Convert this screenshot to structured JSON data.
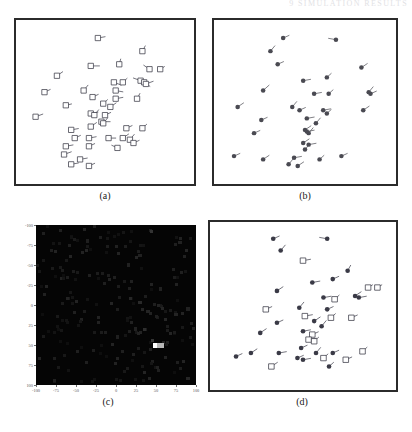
{
  "figure": {
    "running_head": "9 SIMULATION RESULTS",
    "panels": [
      {
        "id": "a",
        "caption": "(a)",
        "type": "scatter-vectors",
        "marker": "open-square-with-tail"
      },
      {
        "id": "b",
        "caption": "(b)",
        "type": "scatter-vectors",
        "marker": "filled-dot-with-tail"
      },
      {
        "id": "c",
        "caption": "(c)",
        "type": "heatmap",
        "marker": "intensity-grid"
      },
      {
        "id": "d",
        "caption": "(d)",
        "type": "scatter-vectors",
        "marker": "mixed-square-and-dot"
      }
    ]
  },
  "chart_data": [
    {
      "type": "scatter",
      "panel": "a",
      "title": "(a)",
      "xlabel": "",
      "ylabel": "",
      "xlim": [
        0,
        100
      ],
      "ylim": [
        0,
        100
      ],
      "grid": false,
      "legend": "none",
      "marker_style": "open square with short vector tail",
      "color": "#3a3a46",
      "points": [
        {
          "x": 46,
          "y": 89,
          "dx": 5,
          "dy": 1
        },
        {
          "x": 71,
          "y": 81,
          "dx": 2,
          "dy": 4
        },
        {
          "x": 42,
          "y": 72,
          "dx": 6,
          "dy": 0
        },
        {
          "x": 58,
          "y": 73,
          "dx": 1,
          "dy": 4
        },
        {
          "x": 75,
          "y": 70,
          "dx": -4,
          "dy": 3
        },
        {
          "x": 81,
          "y": 70,
          "dx": 3,
          "dy": 2
        },
        {
          "x": 23,
          "y": 66,
          "dx": 4,
          "dy": 3
        },
        {
          "x": 55,
          "y": 62,
          "dx": 5,
          "dy": -2
        },
        {
          "x": 60,
          "y": 62,
          "dx": 3,
          "dy": 3
        },
        {
          "x": 70,
          "y": 63,
          "dx": -5,
          "dy": 2
        },
        {
          "x": 72,
          "y": 62,
          "dx": 4,
          "dy": -3
        },
        {
          "x": 73,
          "y": 61,
          "dx": 5,
          "dy": 2
        },
        {
          "x": 16,
          "y": 56,
          "dx": 4,
          "dy": 2
        },
        {
          "x": 38,
          "y": 57,
          "dx": 3,
          "dy": 4
        },
        {
          "x": 56,
          "y": 57,
          "dx": 5,
          "dy": -1
        },
        {
          "x": 43,
          "y": 53,
          "dx": 4,
          "dy": 2
        },
        {
          "x": 56,
          "y": 52,
          "dx": 5,
          "dy": 1
        },
        {
          "x": 68,
          "y": 52,
          "dx": 2,
          "dy": 4
        },
        {
          "x": 49,
          "y": 49,
          "dx": 3,
          "dy": 3
        },
        {
          "x": 28,
          "y": 48,
          "dx": 4,
          "dy": 1
        },
        {
          "x": 53,
          "y": 47,
          "dx": 4,
          "dy": 3
        },
        {
          "x": 42,
          "y": 43,
          "dx": 5,
          "dy": 1
        },
        {
          "x": 44,
          "y": 42,
          "dx": 3,
          "dy": 4
        },
        {
          "x": 50,
          "y": 42,
          "dx": 4,
          "dy": 2
        },
        {
          "x": 11,
          "y": 41,
          "dx": 5,
          "dy": 2
        },
        {
          "x": 48,
          "y": 38,
          "dx": 6,
          "dy": 0
        },
        {
          "x": 49,
          "y": 37,
          "dx": 3,
          "dy": 4
        },
        {
          "x": 42,
          "y": 35,
          "dx": 4,
          "dy": 3
        },
        {
          "x": 31,
          "y": 33,
          "dx": 5,
          "dy": 1
        },
        {
          "x": 62,
          "y": 34,
          "dx": 4,
          "dy": 2
        },
        {
          "x": 71,
          "y": 34,
          "dx": 3,
          "dy": 3
        },
        {
          "x": 33,
          "y": 28,
          "dx": 4,
          "dy": 2
        },
        {
          "x": 41,
          "y": 28,
          "dx": 5,
          "dy": 1
        },
        {
          "x": 52,
          "y": 28,
          "dx": 5,
          "dy": 0
        },
        {
          "x": 60,
          "y": 28,
          "dx": 4,
          "dy": 3
        },
        {
          "x": 64,
          "y": 27,
          "dx": 3,
          "dy": 4
        },
        {
          "x": 66,
          "y": 25,
          "dx": 4,
          "dy": 2
        },
        {
          "x": 28,
          "y": 23,
          "dx": 5,
          "dy": 1
        },
        {
          "x": 41,
          "y": 23,
          "dx": 4,
          "dy": 2
        },
        {
          "x": 57,
          "y": 22,
          "dx": -4,
          "dy": 2
        },
        {
          "x": 27,
          "y": 18,
          "dx": 5,
          "dy": 2
        },
        {
          "x": 36,
          "y": 15,
          "dx": 5,
          "dy": 1
        },
        {
          "x": 31,
          "y": 12,
          "dx": 5,
          "dy": 1
        },
        {
          "x": 41,
          "y": 11,
          "dx": 4,
          "dy": 2
        }
      ]
    },
    {
      "type": "scatter",
      "panel": "b",
      "title": "(b)",
      "xlabel": "",
      "ylabel": "",
      "xlim": [
        0,
        100
      ],
      "ylim": [
        0,
        100
      ],
      "grid": false,
      "legend": "none",
      "marker_style": "filled dot with short vector tail",
      "color": "#4a4a52",
      "points": [
        {
          "x": 38,
          "y": 89,
          "dx": 4,
          "dy": 2
        },
        {
          "x": 67,
          "y": 88,
          "dx": -5,
          "dy": 1
        },
        {
          "x": 31,
          "y": 81,
          "dx": 3,
          "dy": 4
        },
        {
          "x": 35,
          "y": 73,
          "dx": 4,
          "dy": 2
        },
        {
          "x": 81,
          "y": 71,
          "dx": 4,
          "dy": 3
        },
        {
          "x": 62,
          "y": 65,
          "dx": 3,
          "dy": 3
        },
        {
          "x": 49,
          "y": 63,
          "dx": 5,
          "dy": 1
        },
        {
          "x": 27,
          "y": 57,
          "dx": 4,
          "dy": 4
        },
        {
          "x": 55,
          "y": 55,
          "dx": 5,
          "dy": 1
        },
        {
          "x": 63,
          "y": 55,
          "dx": 3,
          "dy": 3
        },
        {
          "x": 85,
          "y": 56,
          "dx": 3,
          "dy": 4
        },
        {
          "x": 86,
          "y": 55,
          "dx": 4,
          "dy": 2
        },
        {
          "x": 13,
          "y": 47,
          "dx": 4,
          "dy": 3
        },
        {
          "x": 43,
          "y": 47,
          "dx": 3,
          "dy": 4
        },
        {
          "x": 47,
          "y": 45,
          "dx": 4,
          "dy": 2
        },
        {
          "x": 60,
          "y": 45,
          "dx": 5,
          "dy": 1
        },
        {
          "x": 62,
          "y": 43,
          "dx": 3,
          "dy": 3
        },
        {
          "x": 82,
          "y": 45,
          "dx": 4,
          "dy": 3
        },
        {
          "x": 26,
          "y": 39,
          "dx": 4,
          "dy": 2
        },
        {
          "x": 51,
          "y": 40,
          "dx": 5,
          "dy": 1
        },
        {
          "x": 56,
          "y": 37,
          "dx": 3,
          "dy": 4
        },
        {
          "x": 50,
          "y": 33,
          "dx": 4,
          "dy": 3
        },
        {
          "x": 51,
          "y": 32,
          "dx": 5,
          "dy": 1
        },
        {
          "x": 52,
          "y": 31,
          "dx": 3,
          "dy": 4
        },
        {
          "x": 22,
          "y": 31,
          "dx": 4,
          "dy": 2
        },
        {
          "x": 49,
          "y": 25,
          "dx": 4,
          "dy": 3
        },
        {
          "x": 52,
          "y": 24,
          "dx": 5,
          "dy": 1
        },
        {
          "x": 50,
          "y": 21,
          "dx": 3,
          "dy": 4
        },
        {
          "x": 11,
          "y": 17,
          "dx": 4,
          "dy": 2
        },
        {
          "x": 27,
          "y": 15,
          "dx": 4,
          "dy": 3
        },
        {
          "x": 44,
          "y": 16,
          "dx": 5,
          "dy": 1
        },
        {
          "x": 58,
          "y": 15,
          "dx": 3,
          "dy": 3
        },
        {
          "x": 70,
          "y": 17,
          "dx": 4,
          "dy": 2
        },
        {
          "x": 46,
          "y": 11,
          "dx": 4,
          "dy": 3
        },
        {
          "x": 41,
          "y": 12,
          "dx": 3,
          "dy": 4
        }
      ]
    },
    {
      "type": "heatmap",
      "panel": "c",
      "title": "(c)",
      "xlabel": "",
      "ylabel": "",
      "xlim": [
        -100,
        100
      ],
      "ylim": [
        -100,
        100
      ],
      "xticks": [
        -100,
        -75,
        -50,
        -25,
        0,
        25,
        50,
        75,
        100
      ],
      "yticks": [
        -100,
        -75,
        -50,
        -25,
        0,
        25,
        50,
        75,
        100
      ],
      "ytick_direction": "top-to-bottom",
      "grid": false,
      "legend": "none",
      "background": "#050505",
      "peak": {
        "x": 50,
        "y": 50,
        "value": 1.0,
        "color": "#ffffff"
      },
      "cells": [
        {
          "x": 50,
          "y": 50,
          "v": 1.0
        },
        {
          "x": 55,
          "y": 50,
          "v": 0.72
        },
        {
          "x": 46,
          "y": 44,
          "v": 0.2
        },
        {
          "x": 36,
          "y": 31,
          "v": 0.18
        },
        {
          "x": 30,
          "y": -3,
          "v": 0.16
        },
        {
          "x": 62,
          "y": 18,
          "v": 0.15
        },
        {
          "x": 75,
          "y": 12,
          "v": 0.14
        },
        {
          "x": 90,
          "y": 5,
          "v": 0.13
        },
        {
          "x": 18,
          "y": -8,
          "v": 0.15
        },
        {
          "x": -6,
          "y": -2,
          "v": 0.14
        },
        {
          "x": -22,
          "y": 22,
          "v": 0.13
        },
        {
          "x": -48,
          "y": 58,
          "v": 0.12
        },
        {
          "x": -36,
          "y": -80,
          "v": 0.12
        },
        {
          "x": 44,
          "y": -92,
          "v": 0.2
        },
        {
          "x": 88,
          "y": -68,
          "v": 0.14
        },
        {
          "x": 80,
          "y": -78,
          "v": 0.13
        },
        {
          "x": 36,
          "y": 84,
          "v": 0.14
        },
        {
          "x": 52,
          "y": 78,
          "v": 0.13
        },
        {
          "x": 90,
          "y": 92,
          "v": 0.15
        },
        {
          "x": 8,
          "y": 58,
          "v": 0.12
        },
        {
          "x": 22,
          "y": 62,
          "v": 0.12
        },
        {
          "x": 68,
          "y": 36,
          "v": 0.14
        },
        {
          "x": 62,
          "y": 66,
          "v": 0.13
        },
        {
          "x": 2,
          "y": 40,
          "v": 0.12
        },
        {
          "x": -18,
          "y": 34,
          "v": 0.11
        },
        {
          "x": 24,
          "y": 30,
          "v": 0.13
        },
        {
          "x": 40,
          "y": 8,
          "v": 0.14
        },
        {
          "x": 56,
          "y": -20,
          "v": 0.13
        },
        {
          "x": 72,
          "y": -44,
          "v": 0.12
        },
        {
          "x": 16,
          "y": -50,
          "v": 0.13
        },
        {
          "x": -2,
          "y": -34,
          "v": 0.12
        },
        {
          "x": 30,
          "y": -62,
          "v": 0.13
        },
        {
          "x": 58,
          "y": 4,
          "v": 0.14
        }
      ]
    },
    {
      "type": "scatter",
      "panel": "d",
      "title": "(d)",
      "xlabel": "",
      "ylabel": "",
      "xlim": [
        0,
        100
      ],
      "ylim": [
        0,
        100
      ],
      "grid": false,
      "legend": "none",
      "marker_style": "mixed filled dots and open squares with tails",
      "color": "#3a3a46",
      "points": [
        {
          "x": 34,
          "y": 90,
          "dx": 4,
          "dy": 2,
          "m": "dot"
        },
        {
          "x": 63,
          "y": 90,
          "dx": -5,
          "dy": 1,
          "m": "dot"
        },
        {
          "x": 38,
          "y": 83,
          "dx": 3,
          "dy": 4,
          "m": "dot"
        },
        {
          "x": 50,
          "y": 77,
          "dx": 5,
          "dy": 1,
          "m": "square"
        },
        {
          "x": 74,
          "y": 71,
          "dx": 2,
          "dy": 4,
          "m": "dot"
        },
        {
          "x": 66,
          "y": 66,
          "dx": 4,
          "dy": 2,
          "m": "dot"
        },
        {
          "x": 55,
          "y": 64,
          "dx": 5,
          "dy": 1,
          "m": "dot"
        },
        {
          "x": 85,
          "y": 61,
          "dx": 3,
          "dy": 2,
          "m": "square"
        },
        {
          "x": 90,
          "y": 61,
          "dx": 3,
          "dy": 2,
          "m": "square"
        },
        {
          "x": 36,
          "y": 59,
          "dx": 4,
          "dy": 3,
          "m": "dot"
        },
        {
          "x": 78,
          "y": 56,
          "dx": 4,
          "dy": 3,
          "m": "dot"
        },
        {
          "x": 80,
          "y": 55,
          "dx": 5,
          "dy": 1,
          "m": "dot"
        },
        {
          "x": 61,
          "y": 55,
          "dx": 5,
          "dy": 1,
          "m": "dot"
        },
        {
          "x": 67,
          "y": 54,
          "dx": 3,
          "dy": 3,
          "m": "square"
        },
        {
          "x": 30,
          "y": 48,
          "dx": 4,
          "dy": 2,
          "m": "square"
        },
        {
          "x": 48,
          "y": 49,
          "dx": 3,
          "dy": 4,
          "m": "dot"
        },
        {
          "x": 63,
          "y": 48,
          "dx": 4,
          "dy": 2,
          "m": "dot"
        },
        {
          "x": 51,
          "y": 44,
          "dx": 5,
          "dy": 1,
          "m": "square"
        },
        {
          "x": 65,
          "y": 43,
          "dx": 3,
          "dy": 3,
          "m": "square"
        },
        {
          "x": 76,
          "y": 43,
          "dx": 4,
          "dy": 2,
          "m": "square"
        },
        {
          "x": 56,
          "y": 41,
          "dx": 4,
          "dy": 3,
          "m": "dot"
        },
        {
          "x": 36,
          "y": 40,
          "dx": 4,
          "dy": 2,
          "m": "dot"
        },
        {
          "x": 60,
          "y": 38,
          "dx": 3,
          "dy": 4,
          "m": "dot"
        },
        {
          "x": 50,
          "y": 35,
          "dx": 5,
          "dy": 1,
          "m": "dot"
        },
        {
          "x": 55,
          "y": 33,
          "dx": 4,
          "dy": 2,
          "m": "square"
        },
        {
          "x": 27,
          "y": 34,
          "dx": 4,
          "dy": 3,
          "m": "dot"
        },
        {
          "x": 53,
          "y": 30,
          "dx": 5,
          "dy": 1,
          "m": "square"
        },
        {
          "x": 56,
          "y": 29,
          "dx": 3,
          "dy": 3,
          "m": "square"
        },
        {
          "x": 49,
          "y": 25,
          "dx": 4,
          "dy": 2,
          "m": "dot"
        },
        {
          "x": 22,
          "y": 22,
          "dx": 4,
          "dy": 3,
          "m": "dot"
        },
        {
          "x": 37,
          "y": 22,
          "dx": 5,
          "dy": 1,
          "m": "dot"
        },
        {
          "x": 57,
          "y": 22,
          "dx": 3,
          "dy": 4,
          "m": "dot"
        },
        {
          "x": 66,
          "y": 22,
          "dx": 4,
          "dy": 2,
          "m": "dot"
        },
        {
          "x": 82,
          "y": 23,
          "dx": 3,
          "dy": 3,
          "m": "square"
        },
        {
          "x": 47,
          "y": 19,
          "dx": 4,
          "dy": 2,
          "m": "dot"
        },
        {
          "x": 50,
          "y": 18,
          "dx": 5,
          "dy": 1,
          "m": "dot"
        },
        {
          "x": 61,
          "y": 19,
          "dx": 3,
          "dy": 3,
          "m": "square"
        },
        {
          "x": 73,
          "y": 18,
          "dx": 4,
          "dy": 2,
          "m": "square"
        },
        {
          "x": 33,
          "y": 14,
          "dx": 4,
          "dy": 3,
          "m": "square"
        },
        {
          "x": 64,
          "y": 14,
          "dx": 3,
          "dy": 3,
          "m": "dot"
        },
        {
          "x": 14,
          "y": 20,
          "dx": 4,
          "dy": 2,
          "m": "dot"
        }
      ]
    }
  ]
}
